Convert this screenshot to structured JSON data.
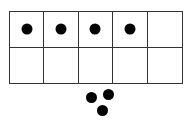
{
  "ten_frame": {
    "rows": 2,
    "columns": 5,
    "filled": [
      true,
      true,
      true,
      true,
      false,
      false,
      false,
      false,
      false,
      false
    ]
  },
  "loose_counters": [
    {
      "x": 91,
      "y": 97
    },
    {
      "x": 108,
      "y": 94
    },
    {
      "x": 102,
      "y": 110
    }
  ],
  "colors": {
    "line": "#333333",
    "counter": "#000000"
  }
}
